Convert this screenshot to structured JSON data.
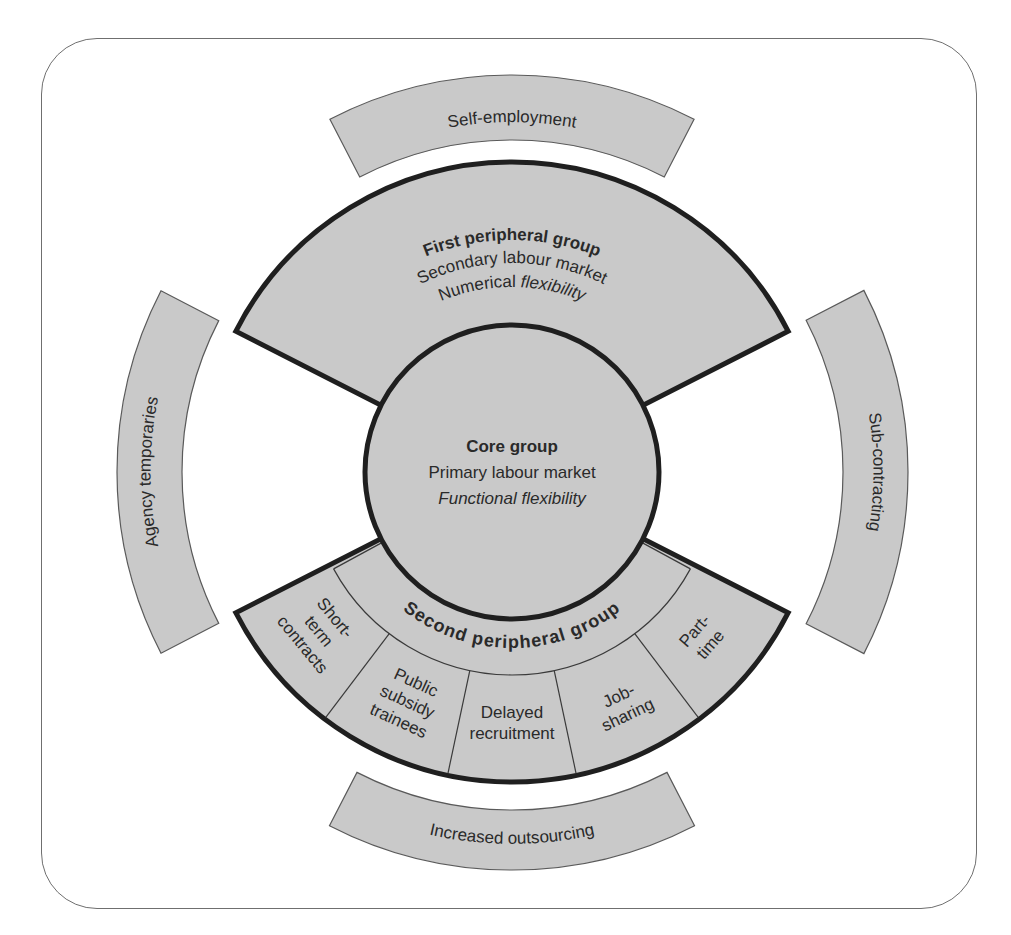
{
  "diagram": {
    "core": {
      "title": "Core group",
      "line2": "Primary labour market",
      "line3": "Functional flexibility"
    },
    "first_peripheral": {
      "title": "First peripheral group",
      "line2": "Secondary labour market",
      "line3_normal": "Numerical ",
      "line3_italic": "flexibility"
    },
    "second_peripheral": {
      "title": "Second peripheral group",
      "segments": [
        {
          "lines": [
            "Short-",
            "term",
            "contracts"
          ]
        },
        {
          "lines": [
            "Public",
            "subsidy",
            "trainees"
          ]
        },
        {
          "lines": [
            "Delayed",
            "recruitment"
          ]
        },
        {
          "lines": [
            "Job-",
            "sharing"
          ]
        },
        {
          "lines": [
            "Part-",
            "time"
          ]
        }
      ]
    },
    "outer_ring": {
      "top": "Self-employment",
      "left": "Agency temporaries",
      "right": "Sub-contracting",
      "bottom": "Increased outsourcing"
    },
    "colors": {
      "fill": "#c9c9c9",
      "group_stroke": "#1f1f1f",
      "outer_stroke": "#5a5a5a",
      "text": "#2a2a2a",
      "frame": "#6f6f6f"
    }
  }
}
